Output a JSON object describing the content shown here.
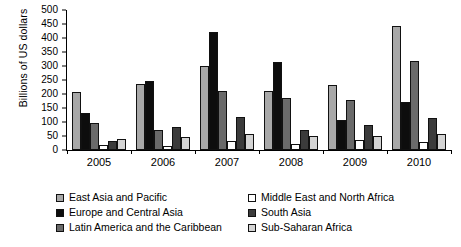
{
  "chart_data": {
    "type": "bar",
    "title": "",
    "xlabel": "",
    "ylabel": "Billions of US dollars",
    "categories": [
      "2005",
      "2006",
      "2007",
      "2008",
      "2009",
      "2010"
    ],
    "ylim": [
      0,
      500
    ],
    "yticks": [
      0,
      50,
      100,
      150,
      200,
      250,
      300,
      350,
      400,
      450,
      500
    ],
    "grid": false,
    "legend_position": "bottom",
    "series": [
      {
        "name": "East Asia and Pacific",
        "color": "#a8a8a8",
        "values": [
          207,
          237,
          301,
          211,
          233,
          442
        ]
      },
      {
        "name": "Europe and Central Asia",
        "color": "#0d0d0d",
        "values": [
          133,
          248,
          420,
          313,
          107,
          172
        ]
      },
      {
        "name": "Latin America and the Caribbean",
        "color": "#6a6a6a",
        "values": [
          98,
          73,
          210,
          185,
          178,
          318
        ]
      },
      {
        "name": "Middle East and North Africa",
        "color": "#ffffff",
        "values": [
          17,
          14,
          33,
          22,
          35,
          28
        ]
      },
      {
        "name": "South Asia",
        "color": "#3b3b3b",
        "values": [
          32,
          83,
          119,
          72,
          91,
          116
        ]
      },
      {
        "name": "Sub-Saharan Africa",
        "color": "#d4d4d4",
        "values": [
          38,
          45,
          57,
          50,
          50,
          58
        ]
      }
    ]
  }
}
